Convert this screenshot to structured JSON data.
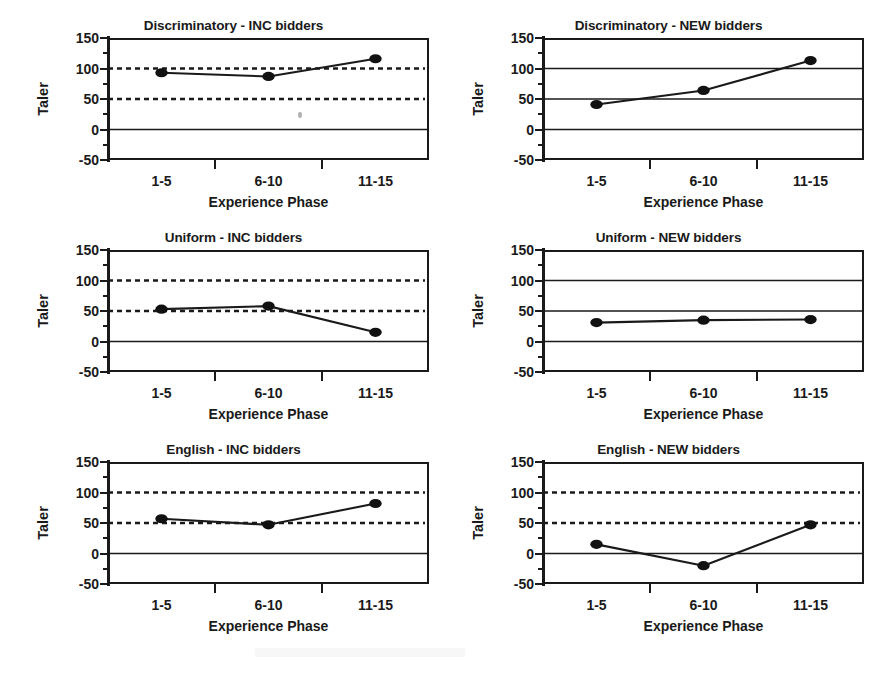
{
  "figure": {
    "panel_count": 6,
    "columns": 2,
    "rows": 3
  },
  "axis": {
    "ylabel": "Taler",
    "xlabel": "Experience Phase",
    "ytick_labels": [
      "150",
      "100",
      "50",
      "0",
      "-50"
    ],
    "ytick_values": [
      150,
      100,
      50,
      0,
      -50
    ],
    "yminor_values": [
      125,
      75,
      25,
      -25
    ],
    "xtick_labels": [
      "1-5",
      "6-10",
      "11-15"
    ],
    "ylim": [
      -50,
      150
    ]
  },
  "colors": {
    "ink": "#1a1a1a",
    "marker": "#111111",
    "reference_line": "#1a1a1a",
    "background": "#ffffff"
  },
  "chart_data": [
    {
      "type": "line",
      "title": "Discriminatory - INC bidders",
      "categories": [
        "1-5",
        "6-10",
        "11-15"
      ],
      "values": [
        93,
        87,
        116
      ],
      "xlabel": "Experience Phase",
      "ylabel": "Taler",
      "ylim": [
        -50,
        150
      ],
      "grid": false,
      "reference_lines": [
        {
          "value": 100,
          "style": "dashed"
        },
        {
          "value": 50,
          "style": "dashed"
        },
        {
          "value": 0,
          "style": "solid"
        }
      ],
      "legend": "none"
    },
    {
      "type": "line",
      "title": "Discriminatory - NEW bidders",
      "categories": [
        "1-5",
        "6-10",
        "11-15"
      ],
      "values": [
        41,
        64,
        113
      ],
      "xlabel": "Experience Phase",
      "ylabel": "Taler",
      "ylim": [
        -50,
        150
      ],
      "grid": false,
      "reference_lines": [
        {
          "value": 100,
          "style": "solid"
        },
        {
          "value": 50,
          "style": "solid"
        },
        {
          "value": 0,
          "style": "solid"
        }
      ],
      "legend": "none"
    },
    {
      "type": "line",
      "title": "Uniform - INC bidders",
      "categories": [
        "1-5",
        "6-10",
        "11-15"
      ],
      "values": [
        53,
        58,
        15
      ],
      "xlabel": "Experience Phase",
      "ylabel": "Taler",
      "ylim": [
        -50,
        150
      ],
      "grid": false,
      "reference_lines": [
        {
          "value": 100,
          "style": "dashed"
        },
        {
          "value": 50,
          "style": "dashed"
        },
        {
          "value": 0,
          "style": "solid"
        }
      ],
      "legend": "none"
    },
    {
      "type": "line",
      "title": "Uniform - NEW bidders",
      "categories": [
        "1-5",
        "6-10",
        "11-15"
      ],
      "values": [
        31,
        35,
        36
      ],
      "xlabel": "Experience Phase",
      "ylabel": "Taler",
      "ylim": [
        -50,
        150
      ],
      "grid": false,
      "reference_lines": [
        {
          "value": 100,
          "style": "solid"
        },
        {
          "value": 50,
          "style": "solid"
        },
        {
          "value": 0,
          "style": "solid"
        }
      ],
      "legend": "none"
    },
    {
      "type": "line",
      "title": "English - INC bidders",
      "categories": [
        "1-5",
        "6-10",
        "11-15"
      ],
      "values": [
        57,
        47,
        82
      ],
      "xlabel": "Experience Phase",
      "ylabel": "Taler",
      "ylim": [
        -50,
        150
      ],
      "grid": false,
      "reference_lines": [
        {
          "value": 100,
          "style": "dashed"
        },
        {
          "value": 50,
          "style": "dashed"
        },
        {
          "value": 0,
          "style": "solid"
        }
      ],
      "legend": "none"
    },
    {
      "type": "line",
      "title": "English - NEW bidders",
      "categories": [
        "1-5",
        "6-10",
        "11-15"
      ],
      "values": [
        15,
        -20,
        47
      ],
      "xlabel": "Experience Phase",
      "ylabel": "Taler",
      "ylim": [
        -50,
        150
      ],
      "grid": false,
      "reference_lines": [
        {
          "value": 100,
          "style": "dashed"
        },
        {
          "value": 50,
          "style": "dashed"
        },
        {
          "value": 0,
          "style": "solid"
        }
      ],
      "legend": "none"
    }
  ]
}
